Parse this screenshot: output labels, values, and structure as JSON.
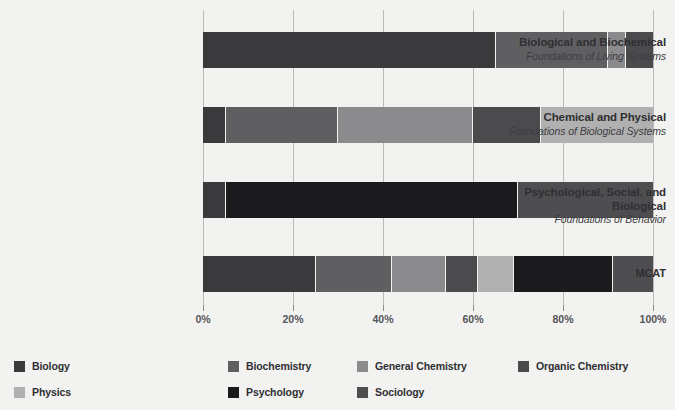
{
  "chart_data": {
    "type": "bar",
    "orientation": "horizontal",
    "stacked": true,
    "normalized": true,
    "title": "",
    "subtitle": "",
    "xlabel": "",
    "ylabel": "",
    "xlim": [
      0,
      100
    ],
    "grid": true,
    "legend_position": "bottom",
    "xticks": [
      0,
      20,
      40,
      60,
      80,
      100
    ],
    "xtick_labels": [
      "0%",
      "20%",
      "40%",
      "60%",
      "80%",
      "100%"
    ],
    "categories": [
      "Biological and Biochemical Foundations of Living Systems",
      "Chemical and Physical Foundations of Biological Systems",
      "Psychological, Social, and Biological Foundations of Behavior",
      "MCAT"
    ],
    "series": [
      {
        "name": "Biology",
        "color": "#3a3a3c",
        "values": [
          65,
          5,
          5,
          25
        ]
      },
      {
        "name": "Biochemistry",
        "color": "#5f5f62",
        "values": [
          25,
          25,
          0,
          17
        ]
      },
      {
        "name": "General Chemistry",
        "color": "#8b8b8d",
        "values": [
          4,
          30,
          0,
          12
        ]
      },
      {
        "name": "Organic Chemistry",
        "color": "#4b4b4e",
        "values": [
          6,
          15,
          0,
          7
        ]
      },
      {
        "name": "Physics",
        "color": "#b0b0b1",
        "values": [
          0,
          25,
          0,
          8
        ]
      },
      {
        "name": "Psychology",
        "color": "#1b1b1d",
        "values": [
          0,
          0,
          65,
          22
        ]
      },
      {
        "name": "Sociology",
        "color": "#4e4e51",
        "values": [
          0,
          0,
          30,
          9
        ]
      }
    ]
  },
  "rows": [
    {
      "line1": "Biological and Biochemical",
      "line2": "Foundations of Living Systems",
      "segments": [
        {
          "series": "Biology",
          "value": 65,
          "color": "#3a3a3c"
        },
        {
          "series": "Biochemistry",
          "value": 25,
          "color": "#5f5f62"
        },
        {
          "series": "General Chemistry",
          "value": 4,
          "color": "#8b8b8d"
        },
        {
          "series": "Organic Chemistry",
          "value": 6,
          "color": "#4b4b4e"
        }
      ]
    },
    {
      "line1": "Chemical and Physical",
      "line2": "Foundations of Biological Systems",
      "segments": [
        {
          "series": "Biology",
          "value": 5,
          "color": "#3a3a3c"
        },
        {
          "series": "Biochemistry",
          "value": 25,
          "color": "#5f5f62"
        },
        {
          "series": "General Chemistry",
          "value": 30,
          "color": "#8b8b8d"
        },
        {
          "series": "Organic Chemistry",
          "value": 15,
          "color": "#4b4b4e"
        },
        {
          "series": "Physics",
          "value": 25,
          "color": "#b0b0b1"
        }
      ]
    },
    {
      "line1": "Psychological, Social, and Biological",
      "line2": "Foundations of Behavior",
      "segments": [
        {
          "series": "Biology",
          "value": 5,
          "color": "#3a3a3c"
        },
        {
          "series": "Psychology",
          "value": 65,
          "color": "#1b1b1d"
        },
        {
          "series": "Sociology",
          "value": 30,
          "color": "#4e4e51"
        }
      ]
    },
    {
      "line1": "MCAT",
      "line2": "",
      "segments": [
        {
          "series": "Biology",
          "value": 25,
          "color": "#3a3a3c"
        },
        {
          "series": "Biochemistry",
          "value": 17,
          "color": "#5f5f62"
        },
        {
          "series": "General Chemistry",
          "value": 12,
          "color": "#8b8b8d"
        },
        {
          "series": "Organic Chemistry",
          "value": 7,
          "color": "#4b4b4e"
        },
        {
          "series": "Physics",
          "value": 8,
          "color": "#b0b0b1"
        },
        {
          "series": "Psychology",
          "value": 22,
          "color": "#1b1b1d"
        },
        {
          "series": "Sociology",
          "value": 9,
          "color": "#4e4e51"
        }
      ]
    }
  ],
  "axis": {
    "ticks": [
      {
        "label": "0%",
        "value": 0
      },
      {
        "label": "20%",
        "value": 20
      },
      {
        "label": "40%",
        "value": 40
      },
      {
        "label": "60%",
        "value": 60
      },
      {
        "label": "80%",
        "value": 80
      },
      {
        "label": "100%",
        "value": 100
      }
    ]
  },
  "legend": {
    "items": [
      {
        "label": "Biology",
        "color": "#3a3a3c"
      },
      {
        "label": "Biochemistry",
        "color": "#5f5f62"
      },
      {
        "label": "General Chemistry",
        "color": "#8b8b8d"
      },
      {
        "label": "Organic Chemistry",
        "color": "#4b4b4e"
      },
      {
        "label": "Physics",
        "color": "#b0b0b1"
      },
      {
        "label": "Psychology",
        "color": "#1b1b1d"
      },
      {
        "label": "Sociology",
        "color": "#4e4e51"
      }
    ]
  },
  "colors": {
    "background": "#f2f2f0",
    "gridline": "#b9b9b7",
    "text": "#2f2f33",
    "tick_text": "#55555a"
  }
}
